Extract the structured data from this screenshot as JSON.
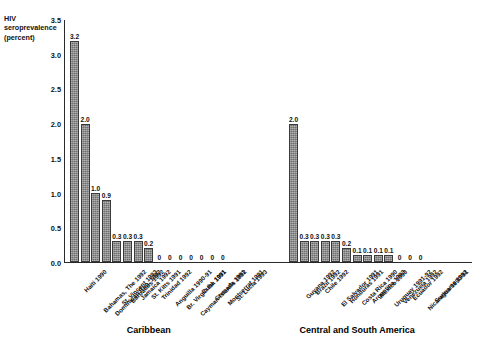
{
  "figure": {
    "cut_title": "",
    "y_axis_label": "HIV\nseroprevalence\n(percent)"
  },
  "chart_data": {
    "type": "bar",
    "title": "",
    "xlabel": "",
    "ylabel": "HIV seroprevalence (percent)",
    "ylim": [
      0.0,
      3.5
    ],
    "ytick_labels": [
      "0.0",
      "0.5",
      "1.0",
      "1.5",
      "2.0",
      "2.5",
      "3.0",
      "3.5"
    ],
    "ytick_values": [
      0.0,
      0.5,
      1.0,
      1.5,
      2.0,
      2.5,
      3.0,
      3.5
    ],
    "grid": false,
    "legend": "none",
    "groups": [
      {
        "name": "Caribbean",
        "categories": [
          "Haiti 1990",
          "Bahamas, The 1992",
          "Dominican Rep. 1992",
          "St. Vincent 1993",
          "Barbados 1992",
          "Jamaica 1992",
          "St. Kitts 1991",
          "Trinidad 1992",
          "Anguilla 1990-91",
          "Br. Virgin Isl. 1991",
          "Cayman Islands 1992",
          "Cuba 1991",
          "Grenada 1991",
          "Montserrat 1991",
          "St. Lucia 1993"
        ],
        "values": [
          3.2,
          2.0,
          1.0,
          0.9,
          0.3,
          0.3,
          0.3,
          0.2,
          0,
          0,
          0,
          0,
          0,
          0,
          0
        ],
        "value_labels": [
          "3.2",
          "2.0",
          "1.0",
          "0.9",
          "0.3",
          "0.3",
          "0.3",
          "0.2",
          "0",
          "0",
          "0",
          "0",
          "0",
          "0",
          "0"
        ]
      },
      {
        "name": "Central and South America",
        "categories": [
          "Guyana 1992",
          "Brazil 1992",
          "Chile 1992",
          "El Salvador 1991",
          "Honduras 1991",
          "Costa Rica 1990",
          "Argentina 1993",
          "Mexico 1993",
          "Uruguay 1991-92",
          "Venezuela 1992",
          "Ecuador 1992",
          "Nicaragua 1990-91",
          "Suriname 1992"
        ],
        "values": [
          2.0,
          0.3,
          0.3,
          0.3,
          0.3,
          0.2,
          0.1,
          0.1,
          0.1,
          0.1,
          0,
          0,
          0
        ],
        "value_labels": [
          "2.0",
          "0.3",
          "0.3",
          "0.3",
          "0.3",
          "0.2",
          "0.1",
          "0.1",
          "0.1",
          "0.1",
          "0",
          "0",
          "0"
        ]
      }
    ],
    "colors": {
      "bar_fill": "#6d6d6d",
      "bar_edge": "#3a3a3a",
      "axis": "#2a2a2a",
      "text": "#111111",
      "background": "#ffffff"
    }
  }
}
